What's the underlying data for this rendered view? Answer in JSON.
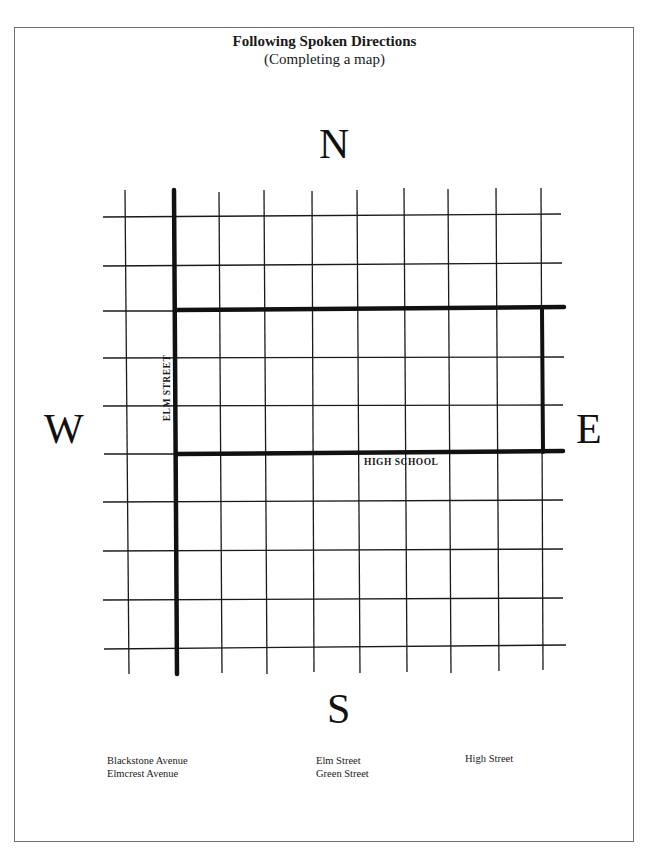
{
  "page": {
    "title": "Following Spoken Directions",
    "subtitle": "(Completing a map)"
  },
  "compass": {
    "north": "N",
    "south": "S",
    "east": "E",
    "west": "W"
  },
  "map": {
    "labels": {
      "elm_street": "ELM STREET",
      "high_school": "HIGH SCHOOL"
    },
    "grid": {
      "vertical_lines_x": [
        126,
        173,
        219,
        264,
        312,
        357,
        403,
        448,
        496,
        541
      ],
      "horizontal_lines_y": [
        217,
        265,
        310,
        358,
        405,
        453,
        500,
        550,
        598,
        648
      ],
      "thick_vertical": "Elm Street at x=173",
      "thick_rectangle": "High School block from x=173 to x=541, y=310 to y=453"
    }
  },
  "street_options": {
    "column_1": [
      "Blackstone Avenue",
      "Elmcrest Avenue"
    ],
    "column_2": [
      "Elm Street",
      "Green Street"
    ],
    "column_3": [
      "High Street"
    ]
  }
}
